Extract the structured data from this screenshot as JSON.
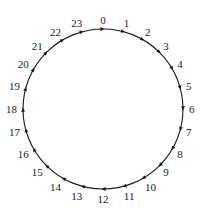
{
  "diagram": {
    "type": "directed-cycle",
    "direction": "clockwise",
    "center": [
      103,
      109
    ],
    "radius": 80,
    "stroke_color": "#1a1a1a",
    "label_color": "#1a1a1a",
    "background": "#ffffff",
    "nodes": [
      {
        "id": 0,
        "label": "0"
      },
      {
        "id": 1,
        "label": "1"
      },
      {
        "id": 2,
        "label": "2"
      },
      {
        "id": 3,
        "label": "3"
      },
      {
        "id": 4,
        "label": "4"
      },
      {
        "id": 5,
        "label": "5"
      },
      {
        "id": 6,
        "label": "6"
      },
      {
        "id": 7,
        "label": "7"
      },
      {
        "id": 8,
        "label": "8"
      },
      {
        "id": 9,
        "label": "9"
      },
      {
        "id": 10,
        "label": "10"
      },
      {
        "id": 11,
        "label": "11"
      },
      {
        "id": 12,
        "label": "12"
      },
      {
        "id": 13,
        "label": "13"
      },
      {
        "id": 14,
        "label": "14"
      },
      {
        "id": 15,
        "label": "15"
      },
      {
        "id": 16,
        "label": "16"
      },
      {
        "id": 17,
        "label": "17"
      },
      {
        "id": 18,
        "label": "18"
      },
      {
        "id": 19,
        "label": "19"
      },
      {
        "id": 20,
        "label": "20"
      },
      {
        "id": 21,
        "label": "21"
      },
      {
        "id": 22,
        "label": "22"
      },
      {
        "id": 23,
        "label": "23"
      }
    ]
  }
}
